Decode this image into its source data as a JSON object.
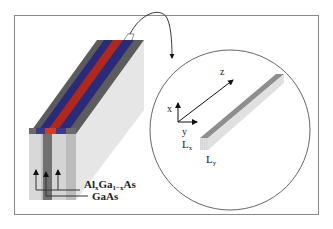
{
  "figure": {
    "type": "schematic",
    "left_panel": {
      "description": "Layered heterostructure bar with striped top surface",
      "layers": [
        {
          "material": "AlxGa1-xAs",
          "color": "#2a2a7a"
        },
        {
          "material": "GaAs",
          "color": "#b0281c"
        },
        {
          "material": "AlxGa1-xAs",
          "color": "#2a2a7a"
        }
      ],
      "labels": {
        "algaas_main": "Al",
        "algaas_sub_x": "x",
        "algaas_ga": "Ga",
        "algaas_sub_1x": "1−x",
        "algaas_as": "As",
        "gaas": "GaAs"
      }
    },
    "right_panel": {
      "description": "Magnified quantum wire in circular inset",
      "axes": {
        "x": "x",
        "y": "y",
        "z": "z"
      },
      "dimension_labels": {
        "lx_main": "L",
        "lx_sub": "x",
        "ly_main": "L",
        "ly_sub": "y"
      }
    },
    "colors": {
      "frame": "#8a8a8a",
      "blue_stripe": "#2a2a7a",
      "red_stripe": "#b0281c",
      "gray_dark": "#5a5a5a",
      "gray_light": "#d8d8d8"
    }
  }
}
